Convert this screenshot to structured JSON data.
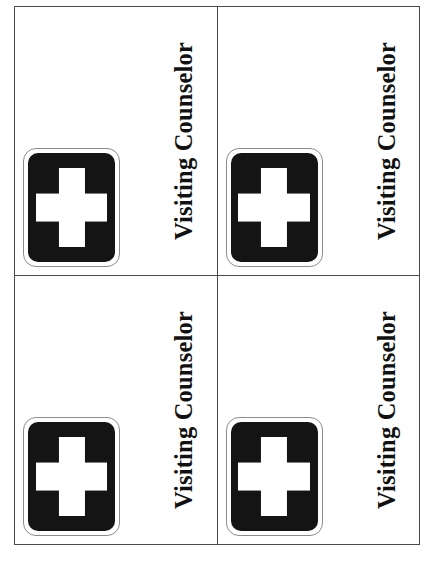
{
  "sheet": {
    "background_color": "#ffffff",
    "grid_line_color": "#4a4a4a",
    "columns": 2,
    "rows": 2
  },
  "badge": {
    "title": "Visiting Counselor",
    "icon_name": "first-aid-cross-icon",
    "icon_plate_color": "#141414",
    "icon_cross_color": "#ffffff",
    "icon_outline_color": "#8c8c8c",
    "title_color": "#111111"
  },
  "cards": [
    {
      "id": "card-top-left",
      "title": "Visiting Counselor",
      "icon_name": "first-aid-cross-icon"
    },
    {
      "id": "card-top-right",
      "title": "Visiting Counselor",
      "icon_name": "first-aid-cross-icon"
    },
    {
      "id": "card-bottom-left",
      "title": "Visiting Counselor",
      "icon_name": "first-aid-cross-icon"
    },
    {
      "id": "card-bottom-right",
      "title": "Visiting Counselor",
      "icon_name": "first-aid-cross-icon"
    }
  ]
}
